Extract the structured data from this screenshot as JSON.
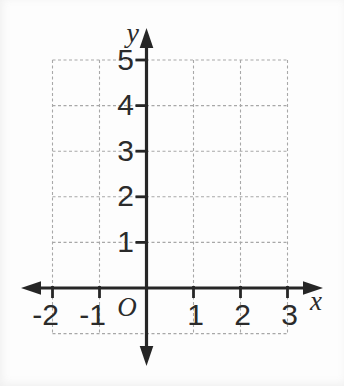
{
  "chart_data": {
    "type": "scatter",
    "title": "",
    "series": [],
    "x_axis": {
      "label": "x",
      "tick_values": [
        -2,
        -1,
        1,
        2,
        3
      ],
      "tick_labels": [
        "-2",
        "-1",
        "1",
        "2",
        "3"
      ],
      "range": [
        -2,
        3
      ]
    },
    "y_axis": {
      "label": "y",
      "tick_values": [
        1,
        2,
        3,
        4,
        5
      ],
      "tick_labels": [
        "1",
        "2",
        "3",
        "4",
        "5"
      ],
      "range": [
        -1,
        5
      ]
    },
    "origin_label": "O",
    "grid": {
      "visible": true,
      "style": "dashed",
      "vertical_lines_at_x": [
        -2,
        -1,
        1,
        2,
        3
      ],
      "horizontal_lines_at_y": [
        -1,
        1,
        2,
        3,
        4,
        5
      ]
    },
    "colors": {
      "axis": "#262626",
      "grid": "#a8a8a8",
      "label": "#2b2b2b",
      "background": "#fdfdfd"
    }
  }
}
